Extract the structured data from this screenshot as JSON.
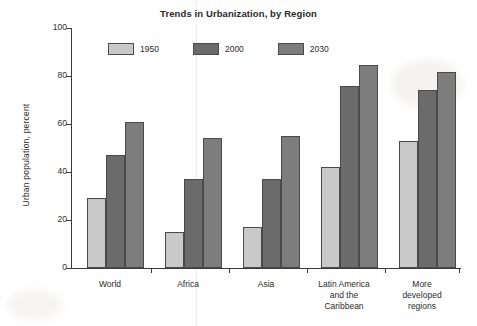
{
  "chart_data": {
    "type": "bar",
    "title": "Trends in Urbanization, by Region",
    "xlabel": "",
    "ylabel": "Urban population, percent",
    "ylim": [
      0,
      100
    ],
    "yticks": [
      0,
      20,
      40,
      60,
      80,
      100
    ],
    "ytick_labels": [
      "0",
      "20",
      "40",
      "60",
      "80",
      "100"
    ],
    "grid": false,
    "legend_position": "upper-left-inside",
    "categories": [
      "World",
      "Africa",
      "Asia",
      "Latin America and the Caribbean",
      "More developed regions"
    ],
    "category_label_lines": [
      [
        "World"
      ],
      [
        "Africa"
      ],
      [
        "Asia"
      ],
      [
        "Latin America",
        "and the",
        "Caribbean"
      ],
      [
        "More",
        "developed",
        "regions"
      ]
    ],
    "series": [
      {
        "name": "1950",
        "color": "#c9c9c9",
        "values": [
          29,
          15,
          17,
          42,
          53
        ]
      },
      {
        "name": "2000",
        "color": "#6b6b6b",
        "values": [
          47,
          37,
          37,
          76,
          74
        ]
      },
      {
        "name": "2030",
        "color": "#7d7d7d",
        "values": [
          61,
          54,
          55,
          84.5,
          81.5
        ]
      }
    ]
  },
  "axis": {
    "line_color": "#3a3a3a",
    "tick_color": "#3a3a3a"
  }
}
